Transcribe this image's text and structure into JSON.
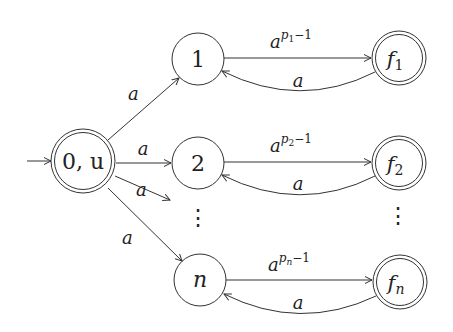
{
  "diagram": {
    "type": "finite-automaton",
    "nodes": [
      {
        "id": "start",
        "label": "0, u",
        "initial": true,
        "accepting": true
      },
      {
        "id": "1",
        "label": "1",
        "accepting": false
      },
      {
        "id": "2",
        "label": "2",
        "accepting": false
      },
      {
        "id": "n",
        "label": "n",
        "accepting": false
      },
      {
        "id": "f1",
        "label": "f",
        "sub": "1",
        "accepting": true
      },
      {
        "id": "f2",
        "label": "f",
        "sub": "2",
        "accepting": true
      },
      {
        "id": "fn",
        "label": "f",
        "sub": "n",
        "accepting": true
      }
    ],
    "edges": [
      {
        "from": "start",
        "to": "1",
        "label": "a"
      },
      {
        "from": "start",
        "to": "2",
        "label": "a"
      },
      {
        "from": "start",
        "to": "…",
        "label": "a"
      },
      {
        "from": "start",
        "to": "n",
        "label": "a"
      },
      {
        "from": "1",
        "to": "f1",
        "label": "a",
        "exp": "p",
        "exp_sub": "1",
        "exp_tail": "−1"
      },
      {
        "from": "f1",
        "to": "1",
        "label": "a"
      },
      {
        "from": "2",
        "to": "f2",
        "label": "a",
        "exp": "p",
        "exp_sub": "2",
        "exp_tail": "−1"
      },
      {
        "from": "f2",
        "to": "2",
        "label": "a"
      },
      {
        "from": "n",
        "to": "fn",
        "label": "a",
        "exp": "p",
        "exp_sub": "n",
        "exp_tail": "−1"
      },
      {
        "from": "fn",
        "to": "n",
        "label": "a"
      }
    ],
    "ellipsis": "⋮"
  }
}
